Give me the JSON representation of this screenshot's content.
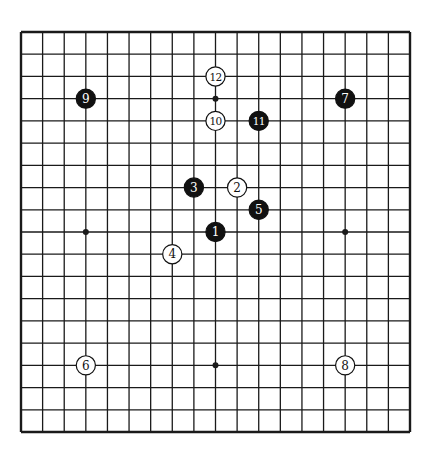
{
  "diagram": {
    "type": "go-board",
    "size": 19,
    "board": {
      "left": 21,
      "top": 32,
      "right": 410,
      "bottom": 432,
      "line_color": "#1a1a1a",
      "background": "#ffffff"
    },
    "hoshi": [
      [
        9,
        3
      ],
      [
        3,
        9
      ],
      [
        15,
        9
      ],
      [
        9,
        15
      ],
      [
        3,
        3
      ],
      [
        15,
        3
      ],
      [
        3,
        15
      ],
      [
        15,
        15
      ],
      [
        9,
        9
      ]
    ],
    "stones": [
      {
        "n": "1",
        "color": "black",
        "col": 9,
        "row": 9
      },
      {
        "n": "2",
        "color": "white",
        "col": 10,
        "row": 7
      },
      {
        "n": "3",
        "color": "black",
        "col": 8,
        "row": 7
      },
      {
        "n": "4",
        "color": "white",
        "col": 7,
        "row": 10
      },
      {
        "n": "5",
        "color": "black",
        "col": 11,
        "row": 8
      },
      {
        "n": "6",
        "color": "white",
        "col": 3,
        "row": 15
      },
      {
        "n": "7",
        "color": "black",
        "col": 15,
        "row": 3
      },
      {
        "n": "8",
        "color": "white",
        "col": 15,
        "row": 15
      },
      {
        "n": "9",
        "color": "black",
        "col": 3,
        "row": 3
      },
      {
        "n": "10",
        "color": "white",
        "col": 9,
        "row": 4
      },
      {
        "n": "11",
        "color": "black",
        "col": 11,
        "row": 4
      },
      {
        "n": "12",
        "color": "white",
        "col": 9,
        "row": 2
      }
    ],
    "colors": {
      "black_stone": "#111111",
      "white_stone": "#ffffff",
      "black_text": "#ffffff",
      "white_text": "#111111"
    }
  }
}
